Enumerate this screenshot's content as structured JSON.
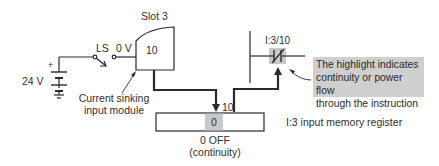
{
  "diagram": {
    "type": "PLC current sinking input circuit",
    "power_supply": {
      "label": "24 V",
      "polarity": "+"
    },
    "switch": {
      "label": "LS"
    },
    "terminal_voltage": "0 V",
    "module": {
      "slot_label": "Slot 3",
      "terminal": "10",
      "caption_line1": "Current sinking",
      "caption_line2": "input module"
    },
    "register": {
      "bit_label": "10",
      "bit_value": "0",
      "name": "I:3 input memory register",
      "state_line1": "0 OFF",
      "state_line2": "(continuity)"
    },
    "ladder": {
      "instruction_address": "I:3/10",
      "instruction_type": "examine-if-open (normally closed contact)"
    },
    "note": {
      "line1": "The highlight indicates",
      "line2": "continuity or power flow",
      "line3": "through the instruction"
    },
    "colors": {
      "line": "#2a2a2a",
      "highlight": "#cfcfcf"
    }
  }
}
